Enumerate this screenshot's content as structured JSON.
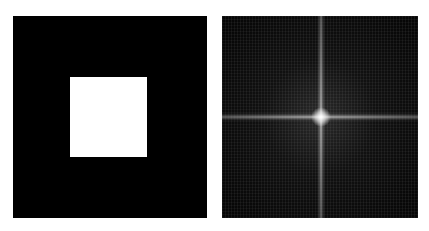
{
  "figure": {
    "panels": [
      {
        "id": "spatial",
        "description": "white square on black background",
        "background": "#000000",
        "foreground": "#ffffff"
      },
      {
        "id": "spectrum",
        "description": "Fourier magnitude spectrum with bright central cross",
        "background": "#000000",
        "foreground": "#e6e6e6"
      }
    ]
  }
}
